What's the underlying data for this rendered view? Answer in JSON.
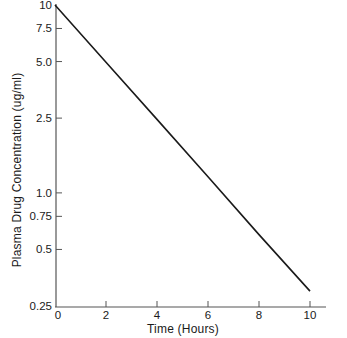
{
  "chart_data": {
    "type": "line",
    "title": "",
    "xlabel": "Time (Hours)",
    "ylabel": "Plasma Drug Concentration (ug/ml)",
    "xlim": [
      0,
      10
    ],
    "ylim": [
      0.25,
      10
    ],
    "yscale": "log",
    "grid": false,
    "legend": null,
    "x_ticks": [
      0,
      2,
      4,
      6,
      8,
      10
    ],
    "x_tick_labels": [
      "0",
      "2",
      "4",
      "6",
      "8",
      "10"
    ],
    "y_ticks": [
      10,
      7.5,
      5.0,
      2.5,
      1.0,
      0.75,
      0.5,
      0.25
    ],
    "y_tick_labels": [
      "10",
      "7.5",
      "5.0",
      "2.5",
      "1.0",
      "0.75",
      "0.5",
      "0.25"
    ],
    "series": [
      {
        "name": "Plasma concentration",
        "color": "#1a1a1a",
        "x": [
          0,
          2,
          4,
          6,
          8,
          10
        ],
        "values": [
          10,
          4.96,
          2.46,
          1.22,
          0.6,
          0.3
        ]
      }
    ]
  },
  "colors": {
    "line": "#1a1a1a",
    "axis": "#555555",
    "background": "#ffffff"
  }
}
